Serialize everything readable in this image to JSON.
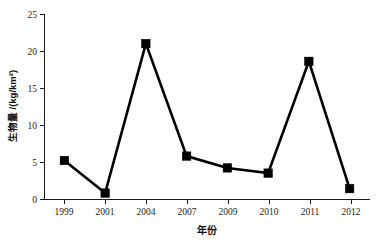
{
  "chart_data": {
    "type": "line",
    "title": "",
    "xlabel": "年份",
    "ylabel": "生物量 /(kg/km²)",
    "categories": [
      "1999",
      "2001",
      "2004",
      "2007",
      "2009",
      "2010",
      "2011",
      "2012"
    ],
    "values": [
      5.2,
      0.8,
      21.0,
      5.8,
      4.2,
      3.5,
      18.6,
      1.4
    ],
    "series": [
      {
        "name": "生物量",
        "values": [
          5.2,
          0.8,
          21.0,
          5.8,
          4.2,
          3.5,
          18.6,
          1.4
        ],
        "marker": "square",
        "marker_color": "#000000",
        "line_color": "#000000"
      }
    ],
    "ylim": [
      0,
      25
    ],
    "yticks": [
      0,
      5,
      10,
      15,
      20,
      25
    ],
    "ytick_labels": [
      "0",
      "5",
      "10",
      "15",
      "20",
      "25"
    ],
    "xtick_labels": [
      "1999",
      "2001",
      "2004",
      "2007",
      "2009",
      "2010",
      "2011",
      "2012"
    ],
    "grid": false,
    "legend": false,
    "legend_position": "none",
    "background_color": "#ffffff",
    "axis_color": "#1a1a1a"
  }
}
